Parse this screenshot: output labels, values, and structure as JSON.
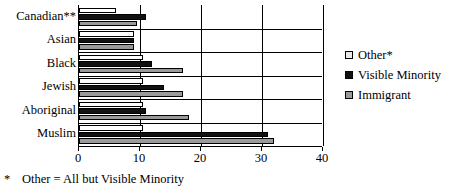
{
  "chart_data": {
    "type": "bar",
    "orientation": "horizontal",
    "title": "",
    "xlabel": "",
    "ylabel": "",
    "xlim": [
      0,
      40
    ],
    "xticks": [
      0,
      10,
      20,
      30,
      40
    ],
    "xtick_labels": [
      "0",
      "10",
      "20",
      "30",
      "40"
    ],
    "grid": true,
    "legend_position": "right",
    "categories": [
      "Canadian**",
      "Asian",
      "Black",
      "Jewish",
      "Aboriginal",
      "Muslim"
    ],
    "series": [
      {
        "name": "Other*",
        "color": "#ffffff",
        "values": [
          6,
          9,
          10.5,
          10.5,
          10.5,
          10.5
        ]
      },
      {
        "name": "Visible Minority",
        "color": "#111111",
        "values": [
          11,
          9,
          12,
          14,
          11,
          31
        ]
      },
      {
        "name": "Immigrant",
        "color": "#9a9a9a",
        "values": [
          9.5,
          9,
          17,
          17,
          18,
          32
        ]
      }
    ]
  },
  "legend": {
    "items": [
      {
        "label": "Other*",
        "swatch": "light-swatch"
      },
      {
        "label": "Visible Minority",
        "swatch": "black-swatch"
      },
      {
        "label": "Immigrant",
        "swatch": "gray-swatch"
      }
    ]
  },
  "footnote": {
    "marker": "*",
    "text": "Other = All but Visible Minority"
  }
}
